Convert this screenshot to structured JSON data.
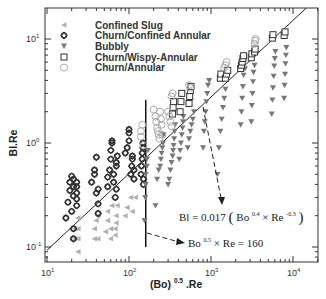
{
  "chart_data": {
    "type": "scatter",
    "title": "",
    "xlabel": "(Bo)^0.5.Re",
    "ylabel": "Bl.Re",
    "xscale": "log",
    "yscale": "log",
    "xlim": [
      10,
      20000
    ],
    "ylim": [
      0.07,
      20
    ],
    "grid": false,
    "legend_position": "upper left",
    "x_ticks": [
      {
        "value": 10,
        "base": "10",
        "exp": "1"
      },
      {
        "value": 100,
        "base": "10",
        "exp": "2"
      },
      {
        "value": 1000,
        "base": "10",
        "exp": "3"
      },
      {
        "value": 10000,
        "base": "10",
        "exp": "4"
      }
    ],
    "y_ticks": [
      {
        "value": 0.1,
        "base": "10",
        "exp": "-1"
      },
      {
        "value": 1,
        "base": "10",
        "exp": "0"
      },
      {
        "value": 10,
        "base": "10",
        "exp": "1"
      }
    ],
    "series": [
      {
        "name": "Confined Slug",
        "marker": "triangle-left",
        "color": "#b0b0b0",
        "points": [
          [
            22,
            0.12
          ],
          [
            22,
            0.15
          ],
          [
            24,
            0.09
          ],
          [
            24,
            0.12
          ],
          [
            24,
            0.15
          ],
          [
            24,
            0.19
          ],
          [
            38,
            0.12
          ],
          [
            38,
            0.15
          ],
          [
            40,
            0.18
          ],
          [
            42,
            0.12
          ],
          [
            42,
            0.2
          ],
          [
            52,
            0.14
          ],
          [
            55,
            0.18
          ],
          [
            55,
            0.22
          ],
          [
            60,
            0.12
          ],
          [
            60,
            0.15
          ],
          [
            62,
            0.25
          ],
          [
            68,
            0.13
          ],
          [
            68,
            0.15
          ],
          [
            70,
            0.17
          ],
          [
            70,
            0.2
          ],
          [
            72,
            0.25
          ],
          [
            90,
            0.2
          ],
          [
            95,
            0.24
          ],
          [
            105,
            0.3
          ],
          [
            110,
            0.22
          ],
          [
            120,
            0.3
          ]
        ]
      },
      {
        "name": "Churn/Confined Annular",
        "marker": "diamond-open",
        "color": "#333333",
        "points": [
          [
            17,
            0.19
          ],
          [
            18,
            0.27
          ],
          [
            19,
            0.35
          ],
          [
            19,
            0.42
          ],
          [
            20,
            0.48
          ],
          [
            20,
            0.22
          ],
          [
            21,
            0.15
          ],
          [
            21,
            0.12
          ],
          [
            21,
            0.31
          ],
          [
            21,
            0.38
          ],
          [
            21,
            0.45
          ],
          [
            23,
            0.25
          ],
          [
            23,
            0.29
          ],
          [
            23,
            0.33
          ],
          [
            23,
            0.38
          ],
          [
            23,
            0.42
          ],
          [
            35,
            0.42
          ],
          [
            38,
            0.5
          ],
          [
            38,
            0.55
          ],
          [
            40,
            0.73
          ],
          [
            40,
            0.33
          ],
          [
            42,
            0.26
          ],
          [
            42,
            0.21
          ],
          [
            42,
            0.36
          ],
          [
            55,
            0.38
          ],
          [
            55,
            0.47
          ],
          [
            58,
            0.55
          ],
          [
            60,
            0.7
          ],
          [
            60,
            0.85
          ],
          [
            62,
            1.0
          ],
          [
            62,
            1.05
          ],
          [
            65,
            0.42
          ],
          [
            65,
            0.5
          ],
          [
            68,
            0.3
          ],
          [
            70,
            0.36
          ],
          [
            70,
            0.6
          ],
          [
            70,
            0.65
          ],
          [
            72,
            0.75
          ],
          [
            90,
            0.8
          ],
          [
            95,
            0.9
          ],
          [
            100,
            1.05
          ],
          [
            100,
            1.25
          ],
          [
            100,
            1.35
          ],
          [
            105,
            0.5
          ],
          [
            108,
            0.6
          ],
          [
            110,
            0.7
          ],
          [
            110,
            0.75
          ],
          [
            115,
            0.45
          ],
          [
            115,
            0.55
          ],
          [
            140,
            0.5
          ],
          [
            142,
            0.6
          ],
          [
            145,
            0.7
          ],
          [
            145,
            0.8
          ],
          [
            148,
            0.9
          ],
          [
            148,
            1.0
          ],
          [
            150,
            0.4
          ],
          [
            150,
            0.45
          ]
        ]
      },
      {
        "name": "Bubbly",
        "marker": "triangle-down",
        "color": "#777777",
        "points": [
          [
            155,
            0.18
          ],
          [
            158,
            0.3
          ],
          [
            160,
            0.4
          ],
          [
            160,
            0.5
          ],
          [
            165,
            0.6
          ],
          [
            165,
            0.7
          ],
          [
            170,
            0.85
          ],
          [
            210,
            0.25
          ],
          [
            220,
            0.45
          ],
          [
            230,
            0.55
          ],
          [
            240,
            0.6
          ],
          [
            245,
            0.7
          ],
          [
            250,
            0.8
          ],
          [
            255,
            0.9
          ],
          [
            260,
            1.0
          ],
          [
            265,
            1.2
          ],
          [
            300,
            0.4
          ],
          [
            310,
            0.45
          ],
          [
            320,
            0.55
          ],
          [
            330,
            0.65
          ],
          [
            340,
            0.75
          ],
          [
            345,
            0.85
          ],
          [
            350,
            0.95
          ],
          [
            355,
            1.1
          ],
          [
            360,
            1.3
          ],
          [
            365,
            1.5
          ],
          [
            410,
            0.7
          ],
          [
            420,
            0.85
          ],
          [
            430,
            1.0
          ],
          [
            440,
            1.2
          ],
          [
            450,
            1.4
          ],
          [
            455,
            1.6
          ],
          [
            460,
            1.8
          ],
          [
            520,
            0.9
          ],
          [
            540,
            1.1
          ],
          [
            560,
            1.3
          ],
          [
            580,
            1.5
          ],
          [
            600,
            1.7
          ],
          [
            620,
            2.0
          ],
          [
            800,
            0.9
          ],
          [
            820,
            1.3
          ],
          [
            840,
            1.6
          ],
          [
            860,
            2.0
          ],
          [
            880,
            2.5
          ],
          [
            900,
            3.0
          ],
          [
            920,
            3.6
          ],
          [
            950,
            4.0
          ],
          [
            1200,
            0.5
          ],
          [
            1250,
            0.9
          ],
          [
            1300,
            1.3
          ],
          [
            1350,
            1.7
          ],
          [
            1400,
            2.2
          ],
          [
            1450,
            2.7
          ],
          [
            1500,
            3.3
          ],
          [
            1550,
            4.2
          ],
          [
            2300,
            1.5
          ],
          [
            2350,
            2.0
          ],
          [
            2400,
            2.7
          ],
          [
            2450,
            3.5
          ],
          [
            2500,
            4.5
          ],
          [
            2600,
            5.2
          ],
          [
            3100,
            1.6
          ],
          [
            3150,
            2.3
          ],
          [
            3200,
            3.0
          ],
          [
            3250,
            3.9
          ],
          [
            3300,
            4.8
          ],
          [
            3400,
            5.6
          ],
          [
            5500,
            1.9
          ],
          [
            5600,
            2.6
          ],
          [
            5700,
            3.4
          ],
          [
            5800,
            4.4
          ],
          [
            5900,
            5.5
          ],
          [
            6000,
            6.5
          ],
          [
            6100,
            7.6
          ],
          [
            7800,
            2.7
          ],
          [
            7900,
            3.6
          ],
          [
            8000,
            4.6
          ],
          [
            8100,
            5.8
          ],
          [
            8200,
            7.0
          ],
          [
            8300,
            8.3
          ]
        ]
      },
      {
        "name": "Churn/Wispy-Annular",
        "marker": "square-open",
        "color": "#333333",
        "points": [
          [
            340,
            1.9
          ],
          [
            345,
            2.2
          ],
          [
            350,
            2.5
          ],
          [
            420,
            2.0
          ],
          [
            430,
            2.5
          ],
          [
            440,
            3.0
          ],
          [
            540,
            2.4
          ],
          [
            550,
            2.8
          ],
          [
            560,
            3.2
          ],
          [
            570,
            3.5
          ],
          [
            1300,
            4.2
          ],
          [
            1320,
            4.6
          ],
          [
            1500,
            4.2
          ],
          [
            1550,
            4.6
          ],
          [
            1600,
            5.0
          ],
          [
            2300,
            5.2
          ],
          [
            2350,
            5.6
          ],
          [
            2400,
            6.0
          ],
          [
            2450,
            6.5
          ],
          [
            2500,
            6.9
          ],
          [
            3100,
            6.6
          ],
          [
            3150,
            7.2
          ],
          [
            3400,
            7.5
          ],
          [
            3450,
            8.0
          ],
          [
            5600,
            10.2
          ],
          [
            5700,
            11.0
          ],
          [
            7800,
            10.8
          ],
          [
            8000,
            11.7
          ]
        ]
      },
      {
        "name": "Churn/Annular",
        "marker": "circle-open",
        "color": "#aaaaaa",
        "points": [
          [
            140,
            1.15
          ],
          [
            140,
            1.3
          ],
          [
            145,
            1.5
          ],
          [
            150,
            0.95
          ],
          [
            200,
            2.1
          ],
          [
            210,
            1.8
          ],
          [
            215,
            1.6
          ],
          [
            220,
            1.4
          ],
          [
            225,
            1.3
          ],
          [
            230,
            1.2
          ],
          [
            235,
            1.1
          ],
          [
            240,
            2.0
          ],
          [
            245,
            1.7
          ],
          [
            250,
            1.5
          ],
          [
            255,
            1.2
          ],
          [
            300,
            2.0
          ],
          [
            310,
            1.8
          ],
          [
            320,
            1.6
          ],
          [
            330,
            1.45
          ],
          [
            330,
            2.8
          ],
          [
            340,
            3.0
          ],
          [
            540,
            3.6
          ],
          [
            560,
            3.4
          ],
          [
            1450,
            5.3
          ],
          [
            1500,
            5.6
          ],
          [
            1550,
            6.0
          ],
          [
            3400,
            9.0
          ],
          [
            3450,
            9.6
          ],
          [
            3500,
            10.0
          ]
        ]
      }
    ],
    "lines": [
      {
        "name": "Bl = 0.017(Bo^0.4 x Re^-0.3) fit",
        "style": "solid",
        "from": [
          10,
          0.093
        ],
        "to": [
          14500,
          20
        ]
      },
      {
        "name": "Bo^0.5 x Re = 160",
        "style": "solid-vertical",
        "x": 160,
        "y_range": [
          0.1,
          2.6
        ]
      }
    ],
    "annotations": [
      {
        "text_main": "Bl = 0.017",
        "text_paren_open": "(",
        "bo": "Bo",
        "bo_exp": "0.4",
        "times": "×",
        "re": "Re",
        "re_exp": "-0.3",
        "text_paren_close": ")",
        "arrow": "dashed"
      },
      {
        "bo": "Bo",
        "bo_exp": "0.5",
        "times": "×",
        "re": "Re",
        "equals": "= 160",
        "arrow": "dashed"
      }
    ]
  },
  "labels": {
    "xlabel_main": "(Bo)",
    "xlabel_exp": "0.5",
    "xlabel_tail": ".Re",
    "ylabel": "Bl.Re",
    "eq1_main": "Bl = 0.017",
    "eq1_bo": "Bo",
    "eq1_bo_exp": "0.4",
    "eq1_times": " × Re",
    "eq1_re_exp": "-0.3",
    "eq2_bo": "Bo",
    "eq2_bo_exp": "0.5",
    "eq2_tail": " × Re = 160"
  }
}
